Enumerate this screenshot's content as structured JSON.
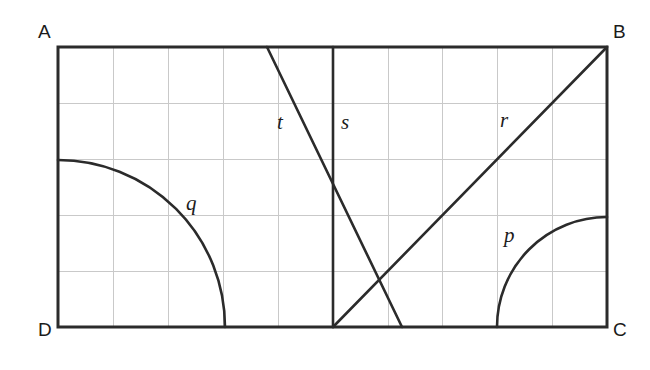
{
  "figure": {
    "type": "geometry-diagram",
    "background_color": "#ffffff",
    "stroke_color": "#2b2b2b",
    "grid_color": "#c9c9c9",
    "rectangle": {
      "name": "ABCD",
      "x": 58,
      "y": 47,
      "width": 549,
      "height": 280,
      "stroke_width": 3
    },
    "grid": {
      "visible": true,
      "columns": 10,
      "rows": 5,
      "cell_width": 54.9,
      "cell_height": 56,
      "x_lines": [
        113,
        168,
        223,
        278,
        333,
        388,
        442,
        497,
        552
      ],
      "y_lines": [
        103,
        159,
        215,
        271
      ]
    },
    "vertices": [
      {
        "id": "A",
        "label": "A",
        "corner": "top-left",
        "x": 38,
        "y": 22
      },
      {
        "id": "B",
        "label": "B",
        "corner": "top-right",
        "x": 613,
        "y": 22
      },
      {
        "id": "C",
        "label": "C",
        "corner": "bottom-right",
        "x": 613,
        "y": 320
      },
      {
        "id": "D",
        "label": "D",
        "corner": "bottom-left",
        "x": 38,
        "y": 320
      }
    ],
    "curves": [
      {
        "id": "p",
        "label": "p",
        "kind": "arc",
        "center": [
          607,
          327
        ],
        "radius": 110,
        "start": [
          497,
          327
        ],
        "end": [
          607,
          217
        ],
        "sweep": "quarter-circle",
        "label_x": 504,
        "label_y": 225
      },
      {
        "id": "q",
        "label": "q",
        "kind": "arc",
        "center": [
          58,
          327
        ],
        "radius": 167,
        "start": [
          58,
          160
        ],
        "end": [
          225,
          327
        ],
        "sweep": "quarter-circle",
        "label_x": 186,
        "label_y": 193
      },
      {
        "id": "r",
        "label": "r",
        "kind": "line",
        "start": [
          333,
          327
        ],
        "end": [
          607,
          47
        ],
        "label_x": 500,
        "label_y": 110
      },
      {
        "id": "s",
        "label": "s",
        "kind": "line",
        "start": [
          333,
          47
        ],
        "end": [
          333,
          327
        ],
        "label_x": 341,
        "label_y": 112
      },
      {
        "id": "t",
        "label": "t",
        "kind": "line",
        "start": [
          267,
          47
        ],
        "end": [
          402,
          327
        ],
        "label_x": 277,
        "label_y": 112
      }
    ]
  }
}
